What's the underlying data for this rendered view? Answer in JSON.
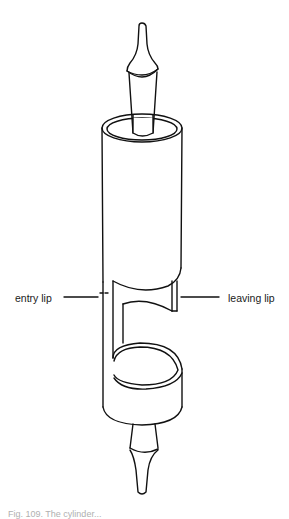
{
  "diagram": {
    "labels": {
      "entry_lip": "entry lip",
      "leaving_lip": "leaving lip"
    },
    "caption": "Fig. 109. The cylinder..."
  },
  "colors": {
    "line": "#111111",
    "background": "#ffffff"
  }
}
